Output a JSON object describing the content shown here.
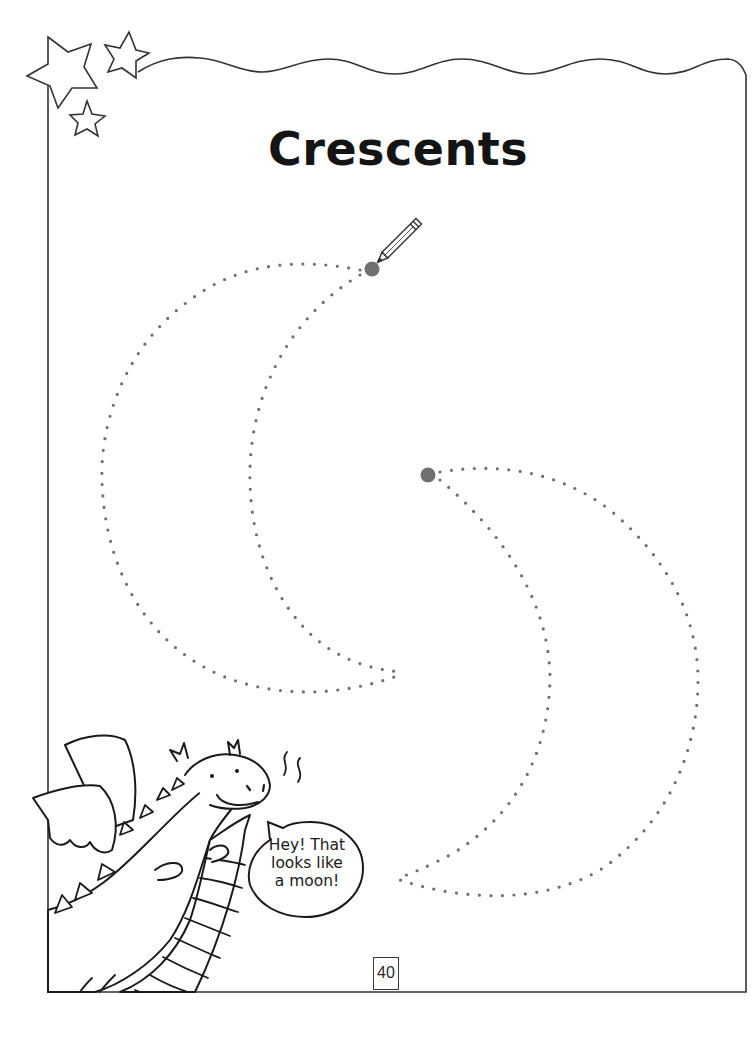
{
  "page": {
    "title": "Crescents",
    "page_number": "40"
  },
  "speech_bubble": {
    "lines": [
      "Hey! That",
      "looks like",
      "a moon!"
    ]
  },
  "tracing": {
    "dot_color": "#6e6e6e",
    "start_dot_color": "#707070",
    "shapes": [
      {
        "name": "crescent-left",
        "start_point": [
          372,
          270
        ]
      },
      {
        "name": "crescent-right",
        "start_point": [
          428,
          475
        ]
      }
    ]
  },
  "decorations": {
    "icons": [
      "star-icon",
      "star-icon",
      "star-icon",
      "pencil-icon",
      "dragon-illustration"
    ],
    "line_color": "#333333"
  }
}
